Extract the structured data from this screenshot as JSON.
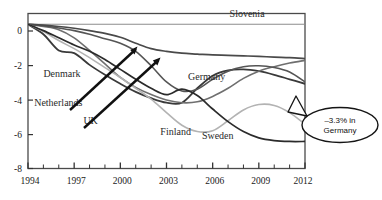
{
  "chart_data": {
    "type": "line",
    "title": "",
    "subtitle": "",
    "xlabel": "",
    "ylabel": "",
    "xlim": [
      1994,
      2012
    ],
    "ylim": [
      -8,
      0.6
    ],
    "grid": false,
    "legend_position": "inline-labels",
    "x_ticks_major": [
      1994,
      1997,
      2000,
      2003,
      2006,
      2009,
      2012
    ],
    "x_ticks_minor_step": 1,
    "y_ticks": [
      0,
      -2,
      -4,
      -6,
      -8
    ],
    "x_tick_labels": [
      "1994",
      "1997",
      "2000",
      "2003",
      "2006",
      "2009",
      "2012"
    ],
    "y_tick_labels": [
      "0",
      "-2",
      "-4",
      "-6",
      "-8"
    ],
    "x": [
      1994,
      1995,
      1996,
      1997,
      1998,
      1999,
      2000,
      2001,
      2002,
      2003,
      2004,
      2005,
      2006,
      2007,
      2008,
      2009,
      2010,
      2011,
      2012
    ],
    "series": [
      {
        "name": "Slovenia",
        "color": "#8d8d8d",
        "width": 1.1,
        "label": "Slovenia",
        "label_x": 2007.1,
        "label_y": 0.42,
        "values": [
          0.0,
          0.0,
          0.0,
          0.0,
          0.0,
          0.0,
          0.0,
          0.0,
          0.0,
          0.0,
          0.0,
          0.0,
          0.0,
          0.0,
          0.0,
          0.0,
          0.0,
          0.0,
          0.0
        ]
      },
      {
        "name": "Denmark",
        "color": "#3a3a3a",
        "width": 1.8,
        "label": "Denmark",
        "label_x": 1995.0,
        "label_y": -2.95,
        "values": [
          0.0,
          -0.55,
          -1.45,
          -1.6,
          -2.25,
          -2.8,
          -3.3,
          -3.75,
          -4.1,
          -4.35,
          -4.35,
          -3.55,
          -2.85,
          -2.55,
          -2.5,
          -2.6,
          -2.8,
          -3.05,
          -3.3
        ]
      },
      {
        "name": "Netherlands",
        "color": "#6f6f6f",
        "width": 1.6,
        "label": "Netherlands",
        "label_x": 1994.4,
        "label_y": -4.55,
        "values": [
          0.0,
          -0.12,
          -0.3,
          -0.75,
          -1.45,
          -2.2,
          -2.95,
          -3.5,
          -3.9,
          -4.2,
          -4.35,
          -4.3,
          -4.0,
          -3.55,
          -3.0,
          -2.6,
          -2.35,
          -2.15,
          -2.0
        ]
      },
      {
        "name": "UK",
        "color": "#555555",
        "width": 1.6,
        "label": "UK",
        "label_x": 1997.6,
        "label_y": -5.55,
        "values": [
          0.0,
          -0.08,
          -0.2,
          -0.35,
          -0.55,
          -0.8,
          -1.05,
          -1.5,
          -2.3,
          -3.2,
          -3.7,
          -3.6,
          -3.05,
          -2.6,
          -2.35,
          -2.3,
          -2.4,
          -2.65,
          -3.2
        ]
      },
      {
        "name": "Germany",
        "color": "#4a4a4a",
        "width": 1.7,
        "label": "Germany",
        "label_x": 2004.4,
        "label_y": -3.1,
        "values": [
          0.0,
          -0.05,
          -0.12,
          -0.22,
          -0.35,
          -0.5,
          -0.72,
          -1.05,
          -1.35,
          -1.5,
          -1.6,
          -1.65,
          -1.7,
          -1.72,
          -1.75,
          -1.78,
          -1.82,
          -1.85,
          -1.9
        ]
      },
      {
        "name": "Finland",
        "color": "#b3b3b3",
        "width": 1.6,
        "label": "Finland",
        "label_x": 2002.6,
        "label_y": -6.15,
        "values": [
          0.0,
          -0.4,
          -0.9,
          -1.35,
          -1.85,
          -2.4,
          -2.95,
          -3.55,
          -4.15,
          -4.9,
          -5.6,
          -5.95,
          -5.9,
          -5.35,
          -4.75,
          -4.45,
          -4.5,
          -4.9,
          -5.55
        ]
      },
      {
        "name": "Sweden",
        "color": "#2b2b2b",
        "width": 1.7,
        "label": "Sweden",
        "label_x": 2005.3,
        "label_y": -6.35,
        "values": [
          0.0,
          -0.35,
          -0.75,
          -1.15,
          -1.5,
          -1.95,
          -2.5,
          -3.05,
          -3.55,
          -3.9,
          -3.6,
          -3.95,
          -4.7,
          -5.4,
          -5.95,
          -6.3,
          -6.45,
          -6.5,
          -6.5
        ]
      }
    ],
    "annotations": [
      {
        "name": "callout-germany",
        "text_line1": "–3.3% in",
        "text_line2": "Germany",
        "shape": "ellipse-callout",
        "value": -3.3,
        "country": "Germany"
      },
      {
        "name": "arrow-netherlands",
        "points_to": "Netherlands"
      },
      {
        "name": "arrow-uk",
        "points_to": "UK"
      }
    ]
  }
}
